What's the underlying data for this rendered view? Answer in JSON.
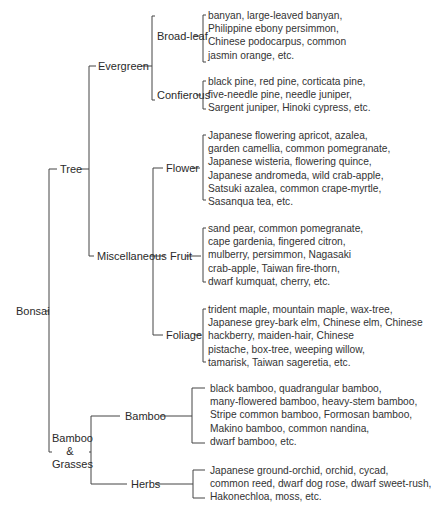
{
  "root": "Bonsai",
  "tree": {
    "label": "Tree",
    "evergreen": {
      "label": "Evergreen",
      "broadleaf": {
        "label": "Broad-leaf",
        "lines": [
          "banyan, large-leaved banyan,",
          "Philippine ebony persimmon,",
          "Chinese podocarpus, common",
          "jasmin orange, etc."
        ]
      },
      "coniferous": {
        "label": "Confierous",
        "lines": [
          "black pine, red pine, corticata pine,",
          "five-needle pine, needle juniper,",
          "Sargent juniper, Hinoki cypress, etc."
        ]
      }
    },
    "miscellaneous": {
      "label": "Miscellaneous",
      "flower": {
        "label": "Flower",
        "lines": [
          "Japanese flowering apricot, azalea,",
          "garden camellia, common pomegranate,",
          "Japanese wisteria, flowering quince,",
          "Japanese andromeda, wild crab-apple,",
          "Satsuki azalea, common crape-myrtle,",
          "Sasanqua tea, etc."
        ]
      },
      "fruit": {
        "label": "Fruit",
        "lines": [
          "sand pear, common pomegranate,",
          "cape gardenia, fingered citron,",
          "mulberry, persimmon, Nagasaki",
          "crab-apple, Taiwan fire-thorn,",
          "dwarf kumquat, cherry, etc."
        ]
      },
      "foliage": {
        "label": "Foliage",
        "lines": [
          "trident maple, mountain maple, wax-tree,",
          "Japanese grey-bark elm, Chinese elm, Chinese",
          "hackberry, maiden-hair, Chinese",
          "pistache, box-tree, weeping willow,",
          "tamarisk, Taiwan sageretia, etc."
        ]
      }
    }
  },
  "bamboo_grasses": {
    "label_lines": [
      "Bamboo",
      "&",
      "Grasses"
    ],
    "bamboo": {
      "label": "Bamboo",
      "lines": [
        "black bamboo, quadrangular bamboo,",
        "many-flowered bamboo, heavy-stem bamboo,",
        "Stripe common bamboo, Formosan bamboo,",
        "Makino bamboo, common nandina,",
        "dwarf bamboo, etc."
      ]
    },
    "herbs": {
      "label": "Herbs",
      "lines": [
        "Japanese ground-orchid, orchid, cycad,",
        "common reed, dwarf dog rose, dwarf sweet-rush,",
        "Hakonechloa, moss, etc."
      ]
    }
  }
}
